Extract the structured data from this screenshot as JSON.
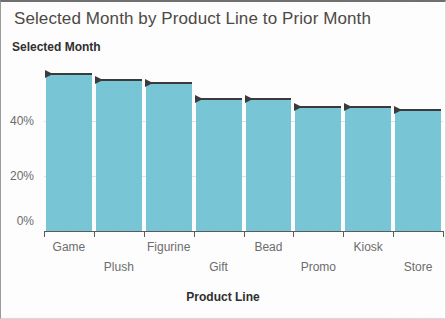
{
  "chart_data": {
    "type": "bar",
    "title": "Selected Month by Product Line to Prior Month",
    "xlabel": "Product Line",
    "ylabel": "Selected Month",
    "categories": [
      "Game",
      "Plush",
      "Figurine",
      "Gift",
      "Bead",
      "Promo",
      "Kiosk",
      "Store"
    ],
    "values": [
      57,
      55,
      54,
      48,
      48,
      45,
      45,
      44
    ],
    "reference_markers": [
      57,
      55,
      54,
      48,
      48,
      45,
      45,
      44
    ],
    "reference_marker_label": "Prior Month",
    "ytick_labels": [
      "0%",
      "20%",
      "40%"
    ],
    "ytick_values": [
      0,
      20,
      40
    ],
    "ylim": [
      0,
      62
    ],
    "grid": true,
    "legend": false,
    "bar_color": "#79c7d7",
    "marker_color": "#3b3b3b",
    "axis_color": "#5c5c5c",
    "grid_color": "#e3e3e3",
    "title_color": "#4e4a46",
    "tick_label_color": "#6d6d6d"
  }
}
